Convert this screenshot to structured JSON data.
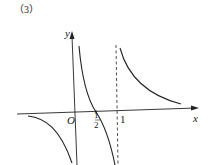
{
  "figure": {
    "label": "（3）",
    "axes": {
      "x_label": "x",
      "y_label": "y",
      "origin_label": "O"
    },
    "ticks": {
      "half_num": "1",
      "half_den": "2",
      "one": "1"
    },
    "asymptote": "x = 1 (dashed)",
    "colors": {
      "stroke": "#222222",
      "background": "#ffffff"
    }
  }
}
